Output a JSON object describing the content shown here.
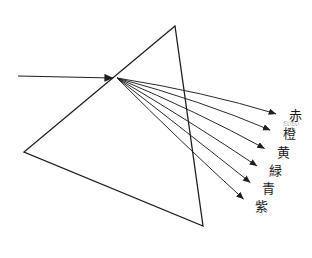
{
  "figure": {
    "background_color": "#ffffff",
    "stroke_color": "#1f1f1f",
    "text_color": "#1a1a1a",
    "ruby_color": "#7a7a7a",
    "width": 312,
    "height": 258
  },
  "prism": {
    "name": "triangular prism",
    "apex": {
      "x": 175,
      "y": 26
    },
    "bottom_left": {
      "x": 24,
      "y": 152
    },
    "bottom_right": {
      "x": 203,
      "y": 226
    },
    "stroke_width": 1.3
  },
  "incident_ray": {
    "name": "white light beam",
    "start": {
      "x": 18,
      "y": 76
    },
    "end": {
      "x": 117,
      "y": 78
    },
    "stroke_width": 1.1,
    "has_arrowhead": true
  },
  "refraction_point": {
    "x": 117,
    "y": 78
  },
  "rays": [
    {
      "id": "red",
      "label": "赤",
      "ruby": "",
      "color_hex": "#e03020",
      "end": {
        "x": 283,
        "y": 116
      },
      "control": {
        "x": 205,
        "y": 92
      },
      "label_pos": {
        "x": 289,
        "y": 116
      }
    },
    {
      "id": "orange",
      "label": "橙",
      "ruby": "だいだい",
      "color_hex": "#ef8a1f",
      "end": {
        "x": 277,
        "y": 133
      },
      "control": {
        "x": 202,
        "y": 101
      },
      "label_pos": {
        "x": 283,
        "y": 134
      },
      "ruby_pos": {
        "x": 283,
        "y": 124
      }
    },
    {
      "id": "yellow",
      "label": "黄",
      "ruby": "",
      "color_hex": "#f2d118",
      "end": {
        "x": 271,
        "y": 152
      },
      "control": {
        "x": 198,
        "y": 112
      },
      "label_pos": {
        "x": 277,
        "y": 153
      }
    },
    {
      "id": "green",
      "label": "緑",
      "ruby": "",
      "color_hex": "#2ea12e",
      "end": {
        "x": 263,
        "y": 170
      },
      "control": {
        "x": 193,
        "y": 123
      },
      "label_pos": {
        "x": 269,
        "y": 171
      }
    },
    {
      "id": "blue",
      "label": "青",
      "ruby": "",
      "color_hex": "#1f5fc4",
      "end": {
        "x": 256,
        "y": 187
      },
      "control": {
        "x": 188,
        "y": 133
      },
      "label_pos": {
        "x": 262,
        "y": 189
      }
    },
    {
      "id": "violet",
      "label": "紫",
      "ruby": "",
      "color_hex": "#7a2ec4",
      "end": {
        "x": 249,
        "y": 204
      },
      "control": {
        "x": 183,
        "y": 144
      },
      "label_pos": {
        "x": 255,
        "y": 207
      }
    }
  ]
}
